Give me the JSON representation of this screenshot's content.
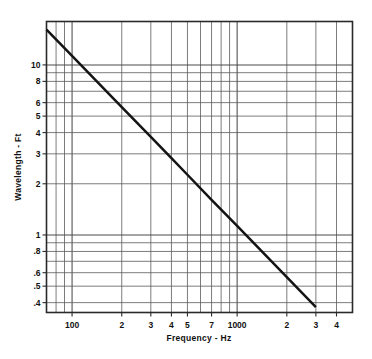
{
  "chart_data": {
    "type": "line",
    "title": "",
    "xlabel": "Frequency - Hz",
    "ylabel": "Wavelength - Ft",
    "xscale": "log",
    "yscale": "log",
    "xlim": [
      70,
      5000
    ],
    "ylim": [
      0.35,
      18
    ],
    "grid": true,
    "legend": "none",
    "x_tick_labels": [
      "100",
      "2",
      "3",
      "4",
      "5",
      "7",
      "1000",
      "2",
      "3",
      "4"
    ],
    "x_tick_values": [
      100,
      200,
      300,
      400,
      500,
      700,
      1000,
      2000,
      3000,
      4000
    ],
    "y_tick_labels": [
      "10",
      "8",
      "6",
      "5",
      "4",
      "3",
      "2",
      "1",
      ".8",
      ".6",
      ".5",
      ".4"
    ],
    "y_tick_values": [
      10,
      8,
      6,
      5,
      4,
      3,
      2,
      1,
      0.8,
      0.6,
      0.5,
      0.4
    ],
    "series": [
      {
        "name": "Wavelength vs Frequency",
        "relation": "wavelength = 1130 / frequency",
        "x": [
          70,
          100,
          200,
          300,
          400,
          500,
          700,
          1000,
          2000,
          3000
        ],
        "y": [
          16.1,
          11.3,
          5.65,
          3.77,
          2.83,
          2.26,
          1.61,
          1.13,
          0.565,
          0.377
        ]
      }
    ]
  },
  "labels": {
    "y_axis_title": "Wavelength - Ft",
    "x_axis_title": "Frequency - Hz"
  }
}
